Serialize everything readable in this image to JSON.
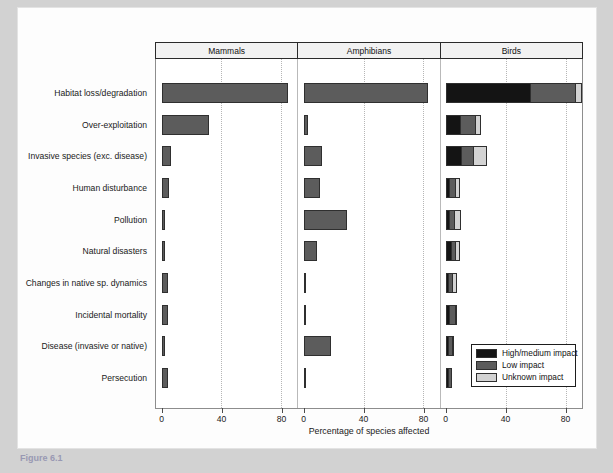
{
  "caption": "Figure 6.1",
  "chart_data": {
    "type": "bar",
    "orientation": "horizontal",
    "title": "",
    "xlabel": "Percentage of species affected",
    "ylabel": "",
    "xlim": [
      0,
      91
    ],
    "xticks": [
      0,
      40,
      80
    ],
    "xticklabels": [
      "0",
      "40",
      "80"
    ],
    "grid": "vertical dotted gridlines at 40 and 80",
    "legend_position": "bottom-right inside Birds panel",
    "panels": [
      "Mammals",
      "Amphibians",
      "Birds"
    ],
    "categories": [
      "Habitat loss/degradation",
      "Over-exploitation",
      "Invasive species (exc. disease)",
      "Human disturbance",
      "Pollution",
      "Natural disasters",
      "Changes in native sp. dynamics",
      "Incidental mortality",
      "Disease (invasive or native)",
      "Persecution"
    ],
    "series": [
      {
        "name": "High/medium impact",
        "color": "#141414"
      },
      {
        "name": "Low impact",
        "color": "#5c5c5c"
      },
      {
        "name": "Unknown impact",
        "color": "#d3d3d3"
      }
    ],
    "panel_data": {
      "Mammals": {
        "stacked": false,
        "values": [
          85,
          32,
          6,
          5,
          2,
          2,
          4,
          4,
          2.5,
          4
        ]
      },
      "Amphibians": {
        "stacked": false,
        "values": [
          83,
          3,
          12,
          11,
          29,
          9,
          0.5,
          1,
          18,
          0.5
        ]
      },
      "Birds": {
        "stacked": true,
        "values": [
          {
            "high_medium": 56,
            "low": 30,
            "unknown": 5
          },
          {
            "high_medium": 9,
            "low": 10,
            "unknown": 4
          },
          {
            "high_medium": 10,
            "low": 8,
            "unknown": 9
          },
          {
            "high_medium": 2,
            "low": 4,
            "unknown": 3
          },
          {
            "high_medium": 2,
            "low": 3,
            "unknown": 5
          },
          {
            "high_medium": 3,
            "low": 3,
            "unknown": 3
          },
          {
            "high_medium": 1,
            "low": 3,
            "unknown": 3
          },
          {
            "high_medium": 2,
            "low": 4,
            "unknown": 1
          },
          {
            "high_medium": 1,
            "low": 3,
            "unknown": 1
          },
          {
            "high_medium": 1,
            "low": 3,
            "unknown": 0
          }
        ]
      }
    }
  },
  "panels": {
    "mammals": "Mammals",
    "amphibians": "Amphibians",
    "birds": "Birds"
  },
  "axis": {
    "xtitle": "Percentage of species affected",
    "tick0": "0",
    "tick40": "40",
    "tick80": "80"
  },
  "legend": {
    "items": [
      {
        "label": "High/medium impact",
        "color": "#141414"
      },
      {
        "label": "Low impact",
        "color": "#5c5c5c"
      },
      {
        "label": "Unknown impact",
        "color": "#d3d3d3"
      }
    ]
  }
}
